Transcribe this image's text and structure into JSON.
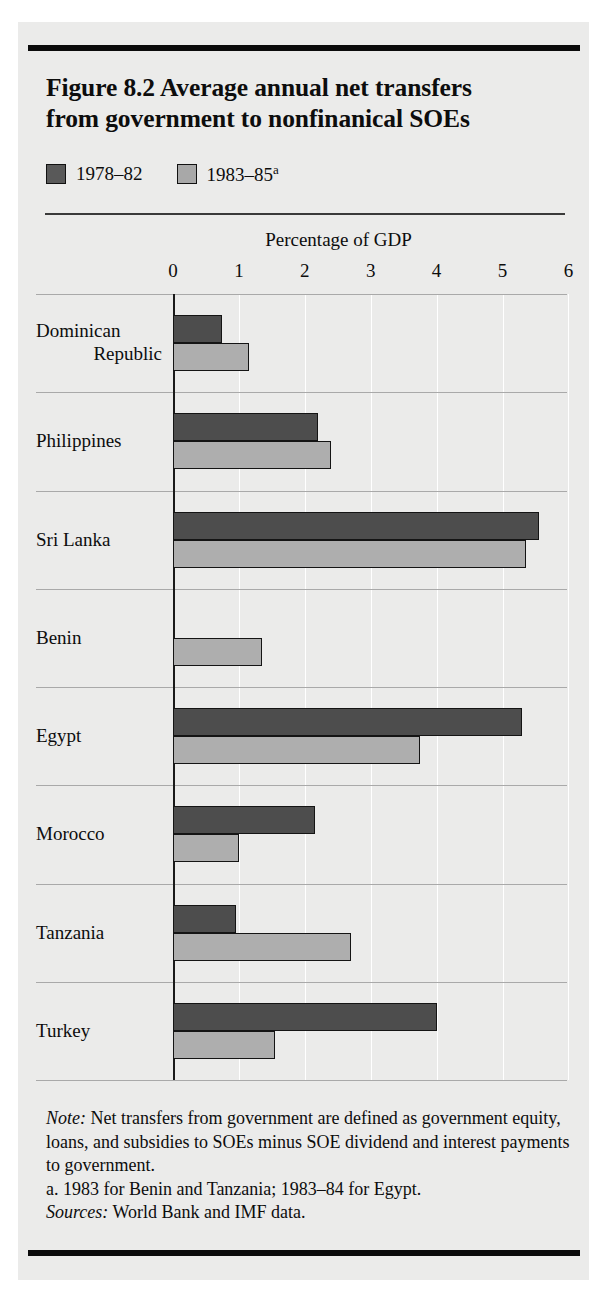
{
  "figure": {
    "title": "Figure 8.2  Average annual net transfers from government to nonfinanical SOEs",
    "title_line1": "Figure 8.2  Average annual net transfers",
    "title_line2": "from government to nonfinanical SOEs"
  },
  "legend": {
    "items": [
      {
        "label": "1978–82",
        "superscript": "",
        "color": "#595959",
        "key": "1978-82"
      },
      {
        "label": "1983–85",
        "superscript": "a",
        "color": "#a8a8a8",
        "key": "1983-85"
      }
    ]
  },
  "axis": {
    "title": "Percentage of GDP",
    "ticks": [
      "0",
      "1",
      "2",
      "3",
      "4",
      "5",
      "6"
    ]
  },
  "footnotes": {
    "note_prefix": "Note:",
    "note_text": " Net transfers from government are defined as government equity, loans, and subsidies to SOEs minus SOE dividend and interest payments to government.",
    "footnote_a": "a.  1983 for Benin and Tanzania; 1983–84 for Egypt.",
    "sources_prefix": "Sources:",
    "sources_text": " World Bank and IMF data."
  },
  "chart_data": {
    "type": "bar",
    "orientation": "horizontal",
    "title": "Figure 8.2  Average annual net transfers from government to nonfinanical SOEs",
    "xlabel": "Percentage of GDP",
    "ylabel": "",
    "xlim": [
      0,
      6
    ],
    "xticks": [
      0,
      1,
      2,
      3,
      4,
      5,
      6
    ],
    "grid": true,
    "legend_position": "top-left",
    "categories": [
      "Dominican Republic",
      "Philippines",
      "Sri Lanka",
      "Benin",
      "Egypt",
      "Morocco",
      "Tanzania",
      "Turkey"
    ],
    "category_lines": [
      [
        "Dominican",
        "Republic"
      ],
      [
        "Philippines"
      ],
      [
        "Sri Lanka"
      ],
      [
        "Benin"
      ],
      [
        "Egypt"
      ],
      [
        "Morocco"
      ],
      [
        "Tanzania"
      ],
      [
        "Turkey"
      ]
    ],
    "series": [
      {
        "name": "1978–82",
        "color": "#4d4d4d",
        "values": [
          0.75,
          2.2,
          5.55,
          null,
          5.3,
          2.15,
          0.95,
          4.0
        ]
      },
      {
        "name": "1983–85",
        "color": "#aeaeae",
        "values": [
          1.15,
          2.4,
          5.35,
          1.35,
          3.75,
          1.0,
          2.7,
          1.55
        ]
      }
    ],
    "note": "Net transfers from government are defined as government equity, loans, and subsidies to SOEs minus SOE dividend and interest payments to government.",
    "footnote_a": "a. 1983 for Benin and Tanzania; 1983–84 for Egypt.",
    "sources": "World Bank and IMF data."
  }
}
